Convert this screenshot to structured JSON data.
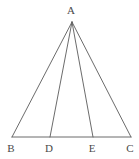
{
  "figure": {
    "type": "geometry-diagram",
    "canvas": {
      "width": 139,
      "height": 159
    },
    "style": {
      "background_color": "#ffffff",
      "line_color": "#5a5a5a",
      "line_width": 0.9,
      "label_color": "#4a4a4a",
      "label_font_size": 11
    },
    "points": [
      {
        "id": "A",
        "label": "A",
        "x": 72,
        "y": 22,
        "label_x": 71,
        "label_y": 10
      },
      {
        "id": "B",
        "label": "B",
        "x": 12,
        "y": 137,
        "label_x": 11,
        "label_y": 148
      },
      {
        "id": "D",
        "label": "D",
        "x": 50,
        "y": 137,
        "label_x": 49,
        "label_y": 148
      },
      {
        "id": "E",
        "label": "E",
        "x": 93,
        "y": 137,
        "label_x": 92,
        "label_y": 148
      },
      {
        "id": "C",
        "label": "C",
        "x": 131,
        "y": 137,
        "label_x": 130,
        "label_y": 148
      }
    ],
    "segments": [
      {
        "id": "AB",
        "from": "A",
        "to": "B",
        "x1": 72,
        "y1": 22,
        "x2": 12,
        "y2": 137
      },
      {
        "id": "AC",
        "from": "A",
        "to": "C",
        "x1": 72,
        "y1": 22,
        "x2": 131,
        "y2": 137
      },
      {
        "id": "AD",
        "from": "A",
        "to": "D",
        "x1": 72,
        "y1": 22,
        "x2": 50,
        "y2": 137
      },
      {
        "id": "AE",
        "from": "A",
        "to": "E",
        "x1": 72,
        "y1": 22,
        "x2": 93,
        "y2": 137
      },
      {
        "id": "BC",
        "from": "B",
        "to": "C",
        "x1": 12,
        "y1": 137,
        "x2": 131,
        "y2": 137
      }
    ]
  }
}
